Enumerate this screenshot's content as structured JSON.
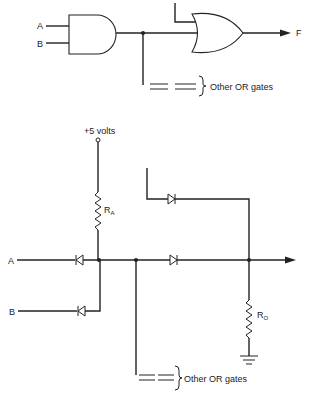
{
  "top_circuit": {
    "inputs": [
      {
        "label": "A"
      },
      {
        "label": "B"
      }
    ],
    "and_gate": {
      "type": "AND"
    },
    "or_gate": {
      "type": "OR"
    },
    "output": {
      "label": "F"
    },
    "other_gates_note": "Other OR gates"
  },
  "bottom_circuit": {
    "supply": {
      "label": "+5 volts"
    },
    "resistor_a": {
      "label": "R",
      "subscript": "A"
    },
    "resistor_o": {
      "label": "R",
      "subscript": "O"
    },
    "inputs": [
      {
        "label": "A"
      },
      {
        "label": "B"
      }
    ],
    "other_gates_note": "Other OR gates"
  },
  "colors": {
    "ink": "#222222",
    "background": "#ffffff"
  }
}
